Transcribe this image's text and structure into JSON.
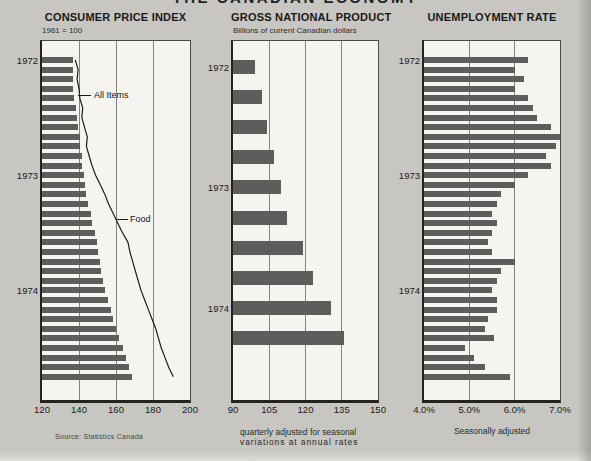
{
  "title": "THE CANADIAN ECONOMY",
  "source": "Source: Statistics Canada",
  "colors": {
    "page_bg": "#c7c6c2",
    "plot_bg": "#f5f4f0",
    "bar": "#5d5d5b",
    "line": "#1c1c1a"
  },
  "chart_data": [
    {
      "id": "cpi",
      "type": "bar",
      "orientation": "horizontal",
      "title": "CONSUMER PRICE INDEX",
      "subtitle": "1961 = 100",
      "xlim": [
        120,
        200
      ],
      "xtick_labels": [
        "120",
        "140",
        "160",
        "180",
        "200"
      ],
      "xtick_values": [
        120,
        140,
        160,
        180,
        200
      ],
      "grid": "vertical",
      "year_labels": [
        "1972",
        "1973",
        "1974"
      ],
      "year_start_rows": [
        0,
        12,
        24
      ],
      "frequency": "monthly",
      "series": [
        {
          "name": "All Items",
          "render": "bars",
          "values": [
            137,
            136.5,
            137,
            136.5,
            137.5,
            138.5,
            139,
            139.5,
            140.5,
            140.5,
            141.5,
            141.5,
            142.5,
            143,
            144,
            145,
            146.5,
            147,
            148.5,
            149.5,
            150.5,
            151.5,
            152,
            153,
            154,
            155.5,
            157,
            158.5,
            160,
            161.5,
            163.5,
            165.5,
            167,
            168.5
          ]
        },
        {
          "name": "Food",
          "render": "line",
          "values": [
            138,
            139.5,
            139,
            140,
            140.5,
            142,
            141.5,
            143,
            144.5,
            144,
            145.5,
            147,
            149,
            151.5,
            154,
            156,
            158.5,
            161,
            163.5,
            166.5,
            167.5,
            169,
            170.5,
            172,
            173.5,
            175.5,
            177.5,
            179.5,
            181.5,
            183,
            184.5,
            186.5,
            188.5,
            191
          ]
        }
      ],
      "annotations": [
        "All Items",
        "Food"
      ]
    },
    {
      "id": "gnp",
      "type": "bar",
      "orientation": "horizontal",
      "title": "GROSS NATIONAL PRODUCT",
      "subtitle": "Billions of current Canadian dollars",
      "footnote_line1": "quarterly adjusted for seasonal",
      "footnote_line2": "variations at annual rates",
      "xlim": [
        90,
        150
      ],
      "xtick_labels": [
        "90",
        "105",
        "120",
        "135",
        "150"
      ],
      "xtick_values": [
        90,
        105,
        120,
        135,
        150
      ],
      "grid": "vertical",
      "year_labels": [
        "1972",
        "1973",
        "1974"
      ],
      "year_start_rows": [
        0,
        4,
        8
      ],
      "frequency": "quarterly",
      "values": [
        99,
        102,
        104,
        107,
        110,
        112.5,
        119,
        123,
        130.5,
        136
      ]
    },
    {
      "id": "unemployment",
      "type": "bar",
      "orientation": "horizontal",
      "title": "UNEMPLOYMENT RATE",
      "footnote": "Seasonally adjusted",
      "xlim": [
        4.0,
        7.0
      ],
      "xtick_labels": [
        "4.0%",
        "5.0%",
        "6.0%",
        "7.0%"
      ],
      "xtick_values": [
        4.0,
        5.0,
        6.0,
        7.0
      ],
      "grid": "vertical",
      "year_labels": [
        "1972",
        "1973",
        "1974"
      ],
      "year_start_rows": [
        0,
        12,
        24
      ],
      "frequency": "monthly",
      "values": [
        6.3,
        6.0,
        6.2,
        6.0,
        6.3,
        6.4,
        6.5,
        6.8,
        7.0,
        6.9,
        6.7,
        6.8,
        6.3,
        6.0,
        5.7,
        5.6,
        5.5,
        5.6,
        5.5,
        5.4,
        5.5,
        6.0,
        5.7,
        5.6,
        5.5,
        5.6,
        5.6,
        5.4,
        5.35,
        5.55,
        4.9,
        5.1,
        5.35,
        5.9
      ]
    }
  ]
}
